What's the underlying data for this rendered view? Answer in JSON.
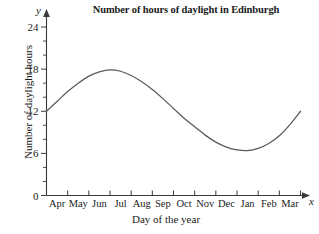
{
  "chart_data": {
    "type": "line",
    "title": "Number of hours of daylight in Edinburgh",
    "xlabel": "Day of the year",
    "ylabel": "Number of daylight hours",
    "axis_letters": {
      "x": "x",
      "y": "y"
    },
    "categories": [
      "Apr",
      "May",
      "Jun",
      "Jul",
      "Aug",
      "Sep",
      "Oct",
      "Nov",
      "Dec",
      "Jan",
      "Feb",
      "Mar"
    ],
    "xlim": [
      0,
      12
    ],
    "ylim": [
      0,
      24
    ],
    "ytick_labels": [
      "0",
      "6",
      "12",
      "18",
      "24"
    ],
    "ytick_values": [
      0,
      6,
      12,
      18,
      24
    ],
    "yminor_step": 2,
    "grid": false,
    "legend": false,
    "series": [
      {
        "name": "Daylight hours",
        "color": "#5a5a5a",
        "x": [
          0,
          0.5,
          1,
          1.5,
          2,
          2.5,
          3,
          3.5,
          4,
          4.5,
          5,
          5.5,
          6,
          6.5,
          7,
          7.5,
          8,
          8.5,
          9,
          9.5,
          10,
          10.5,
          11,
          11.5,
          12
        ],
        "values": [
          12.0,
          13.4,
          14.8,
          16.0,
          17.0,
          17.6,
          17.9,
          17.7,
          17.1,
          16.2,
          15.1,
          13.8,
          12.4,
          11.0,
          9.8,
          8.6,
          7.6,
          6.9,
          6.5,
          6.4,
          6.7,
          7.4,
          8.5,
          10.1,
          12.0
        ]
      }
    ],
    "annotations": {
      "peak_label": "17.9",
      "trough_label": "6.4",
      "start_end_label": "12"
    }
  }
}
